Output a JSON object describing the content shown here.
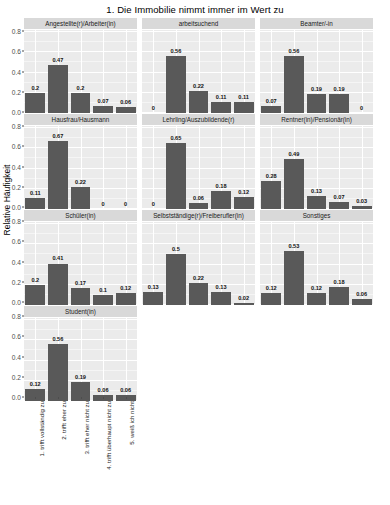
{
  "chart_data": {
    "type": "bar",
    "title": "1. Die Immobilie nimmt immer im Wert zu",
    "xlabel": "",
    "ylabel": "Relative Häufigkeit",
    "ylim": [
      0,
      0.8
    ],
    "ytick_labels": [
      "0.0",
      "0.2",
      "0.4",
      "0.6",
      "0.8"
    ],
    "ytick_values": [
      0,
      0.2,
      0.4,
      0.6,
      0.8
    ],
    "grid": true,
    "legend": "none",
    "facet_layout": {
      "columns": 3,
      "rows": 4
    },
    "categories": [
      "1. trifft vollständig zu",
      "2. trifft eher zu",
      "3. trifft eher nicht zu",
      "4. trifft überhaupt nicht zu",
      "5. weiß ich nicht"
    ],
    "bar_color": "#595959",
    "panel_background": "#ebebeb",
    "strip_background": "#d9d9d9",
    "panels": [
      {
        "name": "Angestellte(r)/Arbeiter(in)",
        "values": [
          0.2,
          0.47,
          0.2,
          0.07,
          0.06
        ],
        "labels": [
          "0.2",
          "0.47",
          "0.2",
          "0.07",
          "0.06"
        ]
      },
      {
        "name": "arbeitsuchend",
        "values": [
          0,
          0.56,
          0.22,
          0.11,
          0.11
        ],
        "labels": [
          "0",
          "0.56",
          "0.22",
          "0.11",
          "0.11"
        ]
      },
      {
        "name": "Beamter/-in",
        "values": [
          0.07,
          0.56,
          0.19,
          0.19,
          0
        ],
        "labels": [
          "0.07",
          "0.56",
          "0.19",
          "0.19",
          "0"
        ]
      },
      {
        "name": "Hausfrau/Hausmann",
        "values": [
          0.11,
          0.67,
          0.22,
          0,
          0
        ],
        "labels": [
          "0.11",
          "0.67",
          "0.22",
          "0",
          "0"
        ]
      },
      {
        "name": "Lehrling/Auszubildende(r)",
        "values": [
          0,
          0.65,
          0.06,
          0.18,
          0.12
        ],
        "labels": [
          "0",
          "0.65",
          "0.06",
          "0.18",
          "0.12"
        ]
      },
      {
        "name": "Rentner(in)/Pensionär(in)",
        "values": [
          0.28,
          0.49,
          0.13,
          0.07,
          0.03
        ],
        "labels": [
          "0.28",
          "0.49",
          "0.13",
          "0.07",
          "0.03"
        ]
      },
      {
        "name": "Schüler(in)",
        "values": [
          0.2,
          0.41,
          0.17,
          0.1,
          0.12
        ],
        "labels": [
          "0.2",
          "0.41",
          "0.17",
          "0.1",
          "0.12"
        ]
      },
      {
        "name": "Selbstständige(r)/Freiberufler(in)",
        "values": [
          0.13,
          0.5,
          0.22,
          0.13,
          0.02
        ],
        "labels": [
          "0.13",
          "0.5",
          "0.22",
          "0.13",
          "0.02"
        ]
      },
      {
        "name": "Sonstiges",
        "values": [
          0.12,
          0.53,
          0.12,
          0.18,
          0.06
        ],
        "labels": [
          "0.12",
          "0.53",
          "0.12",
          "0.18",
          "0.06"
        ]
      },
      {
        "name": "Student(in)",
        "values": [
          0.12,
          0.56,
          0.19,
          0.06,
          0.06
        ],
        "labels": [
          "0.12",
          "0.56",
          "0.19",
          "0.06",
          "0.06"
        ]
      }
    ]
  }
}
